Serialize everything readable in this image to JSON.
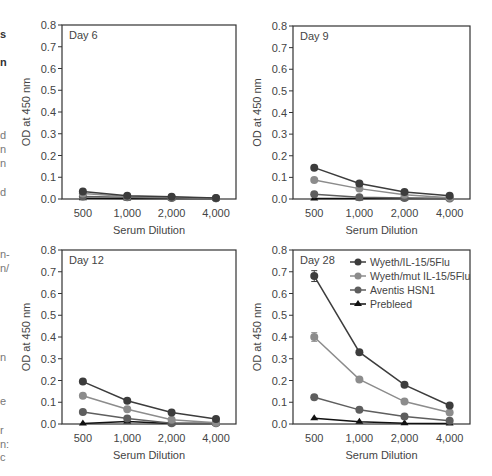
{
  "margin_fragments": [
    {
      "text": "s",
      "x": 0,
      "y": 38,
      "bold": true
    },
    {
      "text": "n",
      "x": 0,
      "y": 66,
      "bold": true
    },
    {
      "text": "d",
      "x": 0,
      "y": 139,
      "bold": false
    },
    {
      "text": "n",
      "x": 0,
      "y": 153,
      "bold": false
    },
    {
      "text": "n",
      "x": 0,
      "y": 167,
      "bold": false
    },
    {
      "text": "d",
      "x": 0,
      "y": 196,
      "bold": false
    },
    {
      "text": "n-",
      "x": 0,
      "y": 258,
      "bold": false
    },
    {
      "text": "n/",
      "x": 0,
      "y": 272,
      "bold": false
    },
    {
      "text": "n",
      "x": 0,
      "y": 361,
      "bold": false
    },
    {
      "text": "e",
      "x": 0,
      "y": 405,
      "bold": false
    },
    {
      "text": "r",
      "x": 0,
      "y": 434,
      "bold": false
    },
    {
      "text": "n:",
      "x": 0,
      "y": 448,
      "bold": false
    },
    {
      "text": "c",
      "x": 0,
      "y": 461,
      "bold": false
    }
  ],
  "colors": {
    "wyeth_il15": "#3c3c3c",
    "wyeth_mut": "#8c8c8c",
    "aventis": "#5e5e5e",
    "prebleed": "#111111",
    "axis": "#333333",
    "text": "#444444"
  },
  "legend": [
    {
      "label": "Wyeth/IL-15/5Flu",
      "marker": "circle",
      "color_key": "wyeth_il15"
    },
    {
      "label": "Wyeth/mut IL-15/5Flu",
      "marker": "circle",
      "color_key": "wyeth_mut"
    },
    {
      "label": "Aventis HSN1",
      "marker": "circle",
      "color_key": "aventis"
    },
    {
      "label": "Prebleed",
      "marker": "triangle",
      "color_key": "prebleed"
    }
  ],
  "chart_data": [
    {
      "type": "line",
      "title": "Day 6",
      "xlabel": "Serum Dilution",
      "ylabel": "OD at 450 nm",
      "categories": [
        "500",
        "1,000",
        "2,000",
        "4,000"
      ],
      "ylim": [
        0,
        0.8
      ],
      "yticks": [
        "0.0",
        "0.1",
        "0.2",
        "0.3",
        "0.4",
        "0.5",
        "0.6",
        "0.7",
        "0.8"
      ],
      "grid": false,
      "legend": false,
      "series": [
        {
          "name": "Wyeth/IL-15/5Flu",
          "values": [
            0.035,
            0.015,
            0.01,
            0.005
          ]
        },
        {
          "name": "Wyeth/mut IL-15/5Flu",
          "values": [
            0.025,
            0.012,
            0.008,
            0.003
          ]
        },
        {
          "name": "Aventis HSN1",
          "values": [
            0.012,
            0.008,
            0.005,
            0.003
          ]
        },
        {
          "name": "Prebleed",
          "values": [
            0.003,
            0.002,
            0.002,
            0.002
          ]
        }
      ]
    },
    {
      "type": "line",
      "title": "Day 9",
      "xlabel": "Serum Dilution",
      "ylabel": "OD at 450 nm",
      "categories": [
        "500",
        "1,000",
        "2,000",
        "4,000"
      ],
      "ylim": [
        0,
        0.8
      ],
      "yticks": [
        "0.0",
        "0.1",
        "0.2",
        "0.3",
        "0.4",
        "0.5",
        "0.6",
        "0.7",
        "0.8"
      ],
      "grid": false,
      "legend": false,
      "series": [
        {
          "name": "Wyeth/IL-15/5Flu",
          "values": [
            0.145,
            0.072,
            0.032,
            0.015
          ]
        },
        {
          "name": "Wyeth/mut IL-15/5Flu",
          "values": [
            0.088,
            0.048,
            0.02,
            0.006
          ]
        },
        {
          "name": "Aventis HSN1",
          "values": [
            0.022,
            0.008,
            0.005,
            0.002
          ]
        },
        {
          "name": "Prebleed",
          "values": [
            0.002,
            0.002,
            0.002,
            0.002
          ]
        }
      ]
    },
    {
      "type": "line",
      "title": "Day 12",
      "xlabel": "Serum Dilution",
      "ylabel": "OD at 450 nm",
      "categories": [
        "500",
        "1,000",
        "2,000",
        "4,000"
      ],
      "ylim": [
        0,
        0.8
      ],
      "yticks": [
        "0.0",
        "0.1",
        "0.2",
        "0.3",
        "0.4",
        "0.5",
        "0.6",
        "0.7",
        "0.8"
      ],
      "grid": false,
      "legend": false,
      "series": [
        {
          "name": "Wyeth/IL-15/5Flu",
          "values": [
            0.195,
            0.107,
            0.053,
            0.023
          ]
        },
        {
          "name": "Wyeth/mut IL-15/5Flu",
          "values": [
            0.13,
            0.068,
            0.02,
            0.006
          ]
        },
        {
          "name": "Aventis HSN1",
          "values": [
            0.055,
            0.025,
            0.003,
            0.003
          ]
        },
        {
          "name": "Prebleed",
          "values": [
            0.002,
            0.012,
            0.002,
            0.002
          ]
        }
      ]
    },
    {
      "type": "line",
      "title": "Day 28",
      "xlabel": "Serum Dilution",
      "ylabel": "OD at 450 nm",
      "categories": [
        "500",
        "1,000",
        "2,000",
        "4,000"
      ],
      "ylim": [
        0,
        0.8
      ],
      "yticks": [
        "0.0",
        "0.1",
        "0.2",
        "0.3",
        "0.4",
        "0.5",
        "0.6",
        "0.7",
        "0.8"
      ],
      "grid": false,
      "legend": true,
      "legend_position": "upper right",
      "series": [
        {
          "name": "Wyeth/IL-15/5Flu",
          "values": [
            0.68,
            0.33,
            0.18,
            0.085
          ],
          "error": [
            0.025,
            0,
            0,
            0
          ]
        },
        {
          "name": "Wyeth/mut IL-15/5Flu",
          "values": [
            0.4,
            0.205,
            0.103,
            0.053
          ],
          "error": [
            0.02,
            0,
            0,
            0
          ]
        },
        {
          "name": "Aventis HSN1",
          "values": [
            0.123,
            0.065,
            0.035,
            0.015
          ]
        },
        {
          "name": "Prebleed",
          "values": [
            0.027,
            0.01,
            0.003,
            0.002
          ]
        }
      ]
    }
  ]
}
